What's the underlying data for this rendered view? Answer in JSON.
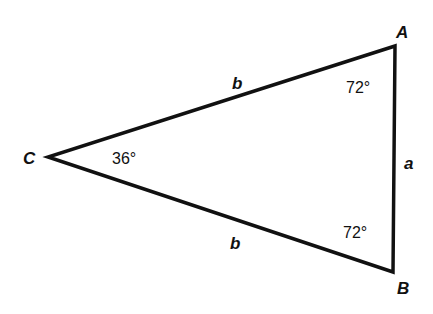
{
  "diagram": {
    "title": "",
    "type": "isosceles triangle",
    "colors": {
      "stroke": "#111111",
      "background": "#ffffff"
    },
    "vertices": [
      {
        "name": "A",
        "x": 395,
        "y": 46,
        "label_x": 396,
        "label_y": 38
      },
      {
        "name": "B",
        "x": 393,
        "y": 272,
        "label_x": 397,
        "label_y": 294
      },
      {
        "name": "C",
        "x": 48,
        "y": 157,
        "label_x": 23,
        "label_y": 164
      }
    ],
    "sides": [
      {
        "label": "b",
        "from": "C",
        "to": "A",
        "label_x": 232,
        "label_y": 89
      },
      {
        "label": "b",
        "from": "C",
        "to": "B",
        "label_x": 230,
        "label_y": 249
      },
      {
        "label": "a",
        "from": "A",
        "to": "B",
        "label_x": 404,
        "label_y": 169
      }
    ],
    "angles": [
      {
        "vertex": "A",
        "label": "72°",
        "label_x": 346,
        "label_y": 93
      },
      {
        "vertex": "B",
        "label": "72°",
        "label_x": 343,
        "label_y": 238
      },
      {
        "vertex": "C",
        "label": "36°",
        "label_x": 112,
        "label_y": 164
      }
    ]
  }
}
